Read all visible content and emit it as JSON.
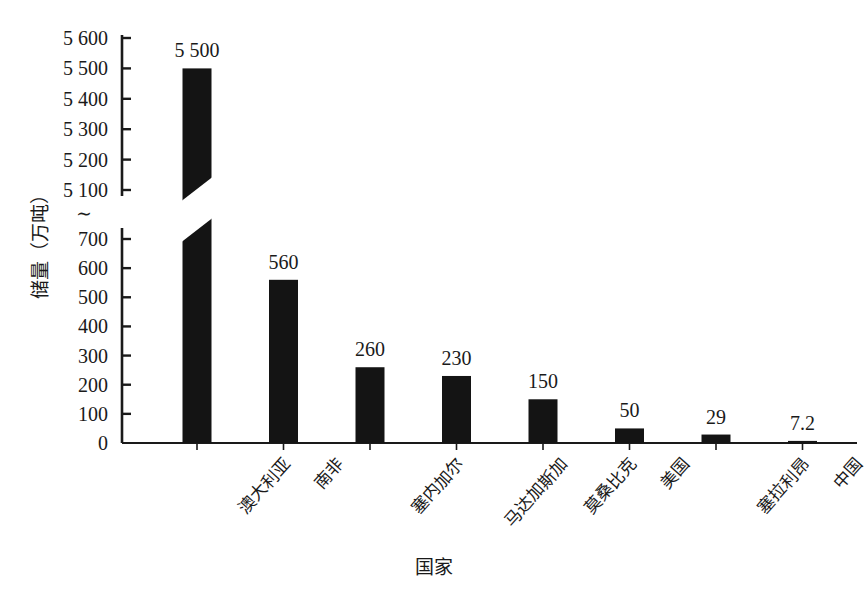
{
  "chart_data": {
    "type": "bar",
    "title": "",
    "xlabel": "国家",
    "ylabel": "储量（万吨）",
    "categories": [
      "澳大利亚",
      "南非",
      "塞内加尔",
      "马达加斯加",
      "莫桑比克",
      "美国",
      "塞拉利昂",
      "中国"
    ],
    "values": [
      5500,
      560,
      260,
      230,
      150,
      50,
      29,
      7.2
    ],
    "value_labels": [
      "5 500",
      "560",
      "260",
      "230",
      "150",
      "50",
      "29",
      "7.2"
    ],
    "axis_break": {
      "symbol": "∼",
      "lower_max": 700,
      "upper_min": 5100
    },
    "y_ticks_lower": [
      0,
      100,
      200,
      300,
      400,
      500,
      600,
      700
    ],
    "y_ticks_lower_labels": [
      "0",
      "100",
      "200",
      "300",
      "400",
      "500",
      "600",
      "700"
    ],
    "y_ticks_upper": [
      5100,
      5200,
      5300,
      5400,
      5500,
      5600
    ],
    "y_ticks_upper_labels": [
      "5 100",
      "5 200",
      "5 300",
      "5 400",
      "5 500",
      "5 600"
    ],
    "ylim_lower": [
      0,
      700
    ],
    "ylim_upper": [
      5100,
      5600
    ],
    "grid": false,
    "legend": false,
    "bar_color": "#141414",
    "axis_color": "#1a1a1a"
  },
  "axis": {
    "y_title": "储量（万吨）",
    "x_title": "国家",
    "break_symbol": "∼"
  },
  "caption": ""
}
